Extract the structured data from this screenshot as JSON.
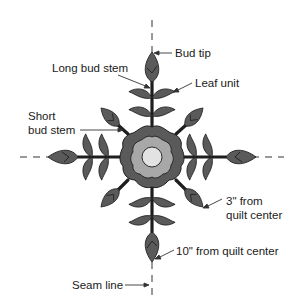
{
  "diagram": {
    "type": "quilt applique block diagram",
    "colors": {
      "dark_fill": "#5a5a5a",
      "mid_fill": "#a8a8a8",
      "light_fill": "#e2e2e2",
      "outline": "#1e1e1e",
      "text": "#1a1a1a"
    },
    "labels": {
      "bud_tip": "Bud tip",
      "long_bud_stem": "Long bud stem",
      "leaf_unit": "Leaf unit",
      "short_bud_stem_line1": "Short",
      "short_bud_stem_line2": "bud stem",
      "three_inch_line1": "3\" from",
      "three_inch_line2": "quilt center",
      "ten_inch": "10\" from quilt center",
      "seam_line": "Seam line"
    }
  }
}
